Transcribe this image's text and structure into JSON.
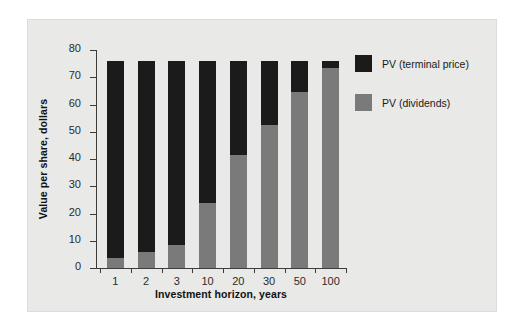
{
  "chart_data": {
    "type": "bar",
    "stacked": true,
    "title": "",
    "xlabel": "Investment horizon, years",
    "ylabel": "Value per share, dollars",
    "categories": [
      "1",
      "2",
      "3",
      "10",
      "20",
      "30",
      "50",
      "100"
    ],
    "series": [
      {
        "name": "PV (dividends)",
        "color": "#7a7a7a",
        "values": [
          3.7,
          5.9,
          8.4,
          23.9,
          41.5,
          52.5,
          64.6,
          73.5
        ]
      },
      {
        "name": "PV (terminal price)",
        "color": "#1b1b1b",
        "values": [
          72.3,
          70.1,
          67.6,
          52.1,
          34.5,
          23.5,
          11.4,
          2.5
        ]
      }
    ],
    "totals": [
      76,
      76,
      76,
      76,
      76,
      76,
      76,
      76
    ],
    "ylim": [
      0,
      80
    ],
    "yticks": [
      0,
      10,
      20,
      30,
      40,
      50,
      60,
      70,
      80
    ],
    "ytick_labels": [
      "0",
      "10",
      "20",
      "30",
      "40",
      "50",
      "60",
      "70",
      "80"
    ],
    "grid": false,
    "legend_position": "right",
    "legend_order": [
      "PV (terminal price)",
      "PV (dividends)"
    ]
  },
  "legend": {
    "entries": [
      {
        "label": "PV (terminal price)",
        "color": "#1b1b1b"
      },
      {
        "label": "PV (dividends)",
        "color": "#7a7a7a"
      }
    ]
  },
  "colors": {
    "panel_background": "#e9e9e7",
    "page_background": "#ffffff",
    "axis": "#3b3b3b",
    "text": "#1a1a1a"
  }
}
